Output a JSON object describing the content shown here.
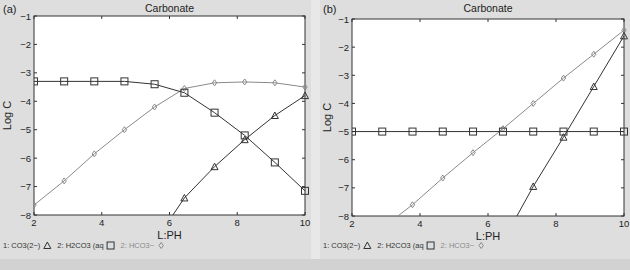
{
  "panels": [
    {
      "label": "(a)",
      "title": "Carbonate",
      "xlabel": "L:PH",
      "ylabel": "Log C",
      "legend": [
        {
          "text": "1: CO3(2−)",
          "marker": "triangle",
          "color": "#333333"
        },
        {
          "text": "2: H2CO3 (aq",
          "marker": "square",
          "color": "#333333"
        },
        {
          "text": "2: HCO3−",
          "marker": "diamond",
          "color": "#8a8a8a"
        }
      ]
    },
    {
      "label": "(b)",
      "title": "Carbonate",
      "xlabel": "L:PH",
      "ylabel": "Log C",
      "legend": [
        {
          "text": "1: CO3(2−)",
          "marker": "triangle",
          "color": "#333333"
        },
        {
          "text": "2: H2CO3 (aq",
          "marker": "square",
          "color": "#333333"
        },
        {
          "text": "2: HCO3−",
          "marker": "diamond",
          "color": "#8a8a8a"
        }
      ]
    }
  ],
  "chart_data": [
    {
      "type": "line",
      "title": "Carbonate",
      "panel": "(a)",
      "xlabel": "L:PH",
      "ylabel": "Log C",
      "xlim": [
        2,
        10
      ],
      "ylim": [
        -8,
        -1
      ],
      "xticks": [
        2,
        4,
        6,
        8,
        10
      ],
      "yticks": [
        -1,
        -2,
        -3,
        -4,
        -5,
        -6,
        -7,
        -8
      ],
      "grid": false,
      "legend_position": "bottom",
      "series": [
        {
          "name": "1: CO3(2−)",
          "marker": "triangle",
          "color": "#333333",
          "x": [
            6.1,
            6.44,
            7.33,
            8.22,
            9.11,
            10
          ],
          "y": [
            -8.0,
            -7.4,
            -6.3,
            -5.35,
            -4.5,
            -3.8
          ]
        },
        {
          "name": "2: H2CO3 (aq",
          "marker": "square",
          "color": "#333333",
          "x": [
            2,
            2.89,
            3.78,
            4.67,
            5.56,
            6.44,
            7.33,
            8.22,
            9.11,
            10
          ],
          "y": [
            -3.3,
            -3.3,
            -3.3,
            -3.3,
            -3.4,
            -3.7,
            -4.4,
            -5.2,
            -6.15,
            -7.15
          ]
        },
        {
          "name": "2: HCO3−",
          "marker": "diamond",
          "color": "#8a8a8a",
          "x": [
            2,
            2.89,
            3.78,
            4.67,
            5.56,
            6.44,
            7.33,
            8.22,
            9.11,
            10
          ],
          "y": [
            -7.65,
            -6.8,
            -5.85,
            -5.0,
            -4.2,
            -3.55,
            -3.35,
            -3.32,
            -3.35,
            -3.5
          ]
        }
      ]
    },
    {
      "type": "line",
      "title": "Carbonate",
      "panel": "(b)",
      "xlabel": "L:PH",
      "ylabel": "Log C",
      "xlim": [
        2,
        10
      ],
      "ylim": [
        -8,
        -1
      ],
      "xticks": [
        2,
        4,
        6,
        8,
        10
      ],
      "yticks": [
        -1,
        -2,
        -3,
        -4,
        -5,
        -6,
        -7,
        -8
      ],
      "grid": false,
      "legend_position": "bottom",
      "series": [
        {
          "name": "1: CO3(2−)",
          "marker": "triangle",
          "color": "#333333",
          "x": [
            6.85,
            7.33,
            8.22,
            9.11,
            10
          ],
          "y": [
            -8.0,
            -6.95,
            -5.2,
            -3.4,
            -1.6
          ]
        },
        {
          "name": "2: H2CO3 (aq",
          "marker": "square",
          "color": "#333333",
          "x": [
            2,
            2.89,
            3.78,
            4.67,
            5.56,
            6.44,
            7.33,
            8.22,
            9.11,
            10
          ],
          "y": [
            -5,
            -5,
            -5,
            -5,
            -5,
            -5,
            -5,
            -5,
            -5,
            -5
          ]
        },
        {
          "name": "2: HCO3−",
          "marker": "diamond",
          "color": "#8a8a8a",
          "x": [
            3.35,
            3.78,
            4.67,
            5.56,
            6.44,
            7.33,
            8.22,
            9.11,
            10
          ],
          "y": [
            -8.0,
            -7.6,
            -6.65,
            -5.75,
            -4.9,
            -4.0,
            -3.1,
            -2.25,
            -1.4
          ]
        }
      ]
    }
  ]
}
